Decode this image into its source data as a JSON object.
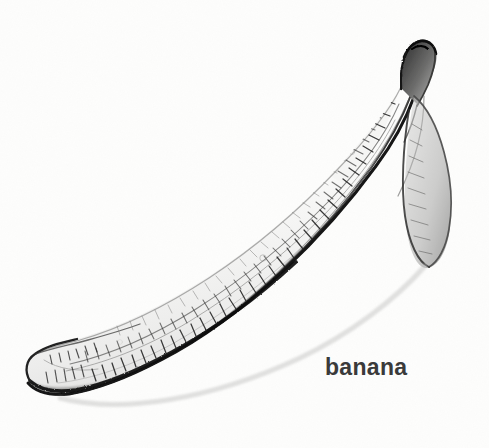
{
  "page": {
    "background_color": "#fdfdfc",
    "width": 489,
    "height": 448
  },
  "header": {
    "serves_label": "Serves 1 – 2"
  },
  "illustration": {
    "caption": "banana",
    "subject": "banana",
    "medium": "pencil sketch",
    "ink_color": "#1d1d1d",
    "shading_color": "#8a8a8a",
    "caption_color": "#3a3a3a"
  }
}
